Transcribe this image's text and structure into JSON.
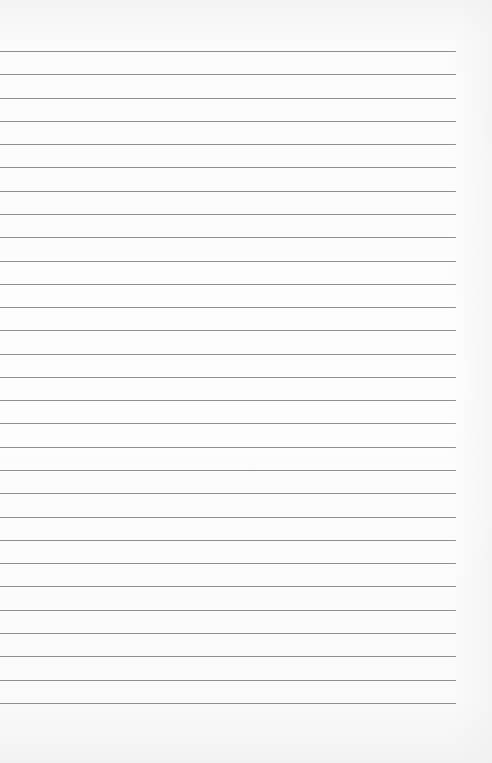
{
  "paper": {
    "type": "lined-paper",
    "line_count": 29,
    "first_line_y": 51,
    "line_spacing": 23.28,
    "line_end_x": 456,
    "colors": {
      "background": "#fafafa",
      "rule": "#8f8f8f"
    }
  }
}
